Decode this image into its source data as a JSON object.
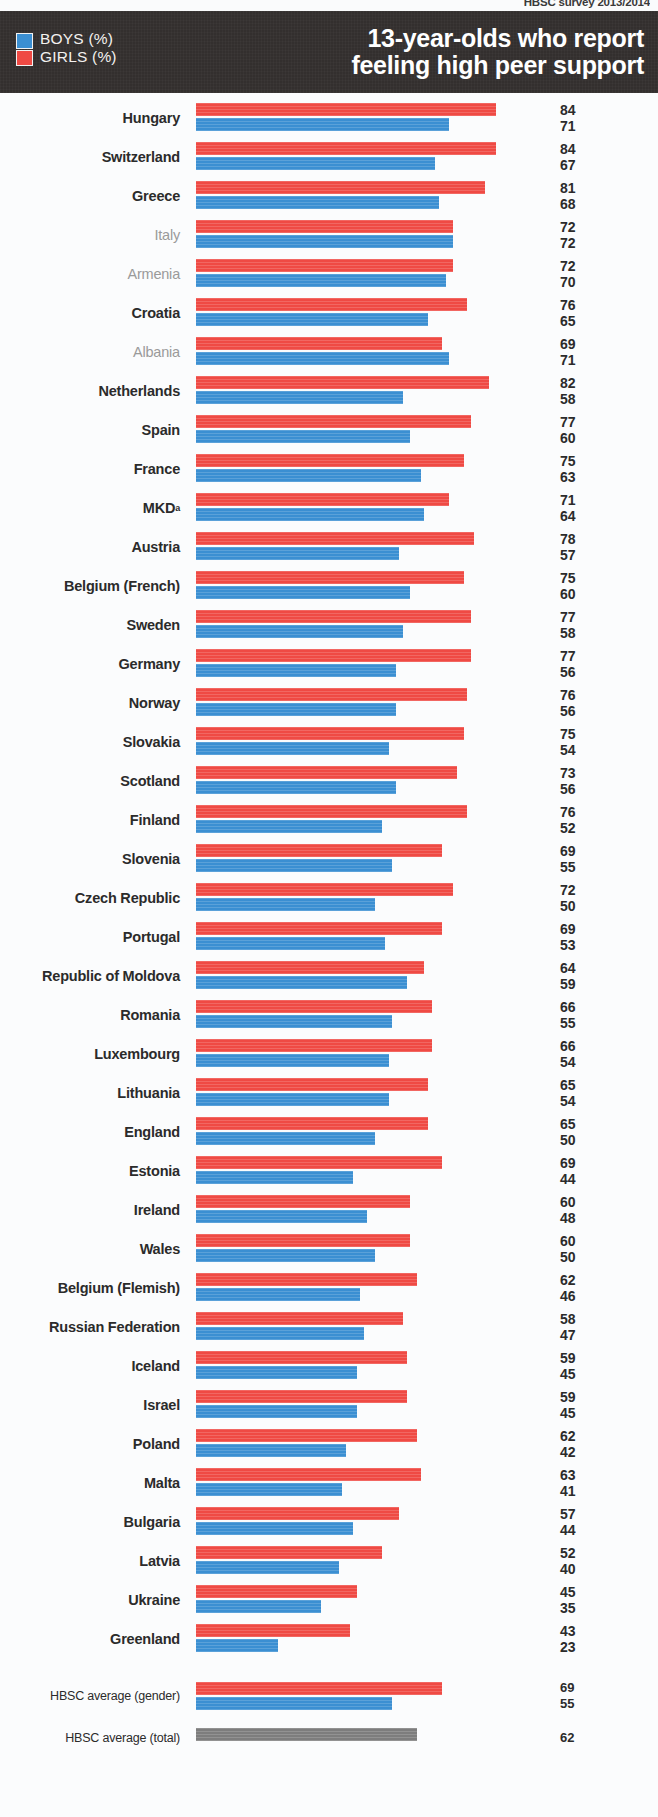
{
  "source_line": "HBSC survey 2013/2014",
  "header": {
    "title": "13-year-olds who report\nfeeling high peer support",
    "legend": [
      {
        "label": "BOYS (%)",
        "color": "#3b8fd2",
        "icon": "boys-swatch"
      },
      {
        "label": "GIRLS (%)",
        "color": "#ef4a44",
        "icon": "girls-swatch"
      }
    ]
  },
  "axis": {
    "bar_origin_px": 196,
    "px_per_unit": 3.57
  },
  "averages": [
    {
      "name": "HBSC average (gender)",
      "girls": 69,
      "boys": 55,
      "type": "gender"
    },
    {
      "name": "HBSC average (total)",
      "total": 62,
      "type": "total"
    }
  ],
  "chart_data": {
    "type": "bar",
    "orientation": "horizontal",
    "title": "13-year-olds who report feeling high peer support",
    "subtitle": "HBSC survey 2013/2014",
    "xlabel": "",
    "ylabel": "",
    "xlim": [
      0,
      100
    ],
    "grid": false,
    "legend_position": "top-left",
    "legend": [
      "BOYS (%)",
      "GIRLS (%)"
    ],
    "note": "Countries in grey/non-bold show no significant gender difference. Superscript a on MKD.",
    "categories": [
      "Hungary",
      "Switzerland",
      "Greece",
      "Italy",
      "Armenia",
      "Croatia",
      "Albania",
      "Netherlands",
      "Spain",
      "France",
      "MKD",
      "Austria",
      "Belgium (French)",
      "Sweden",
      "Germany",
      "Norway",
      "Slovakia",
      "Scotland",
      "Finland",
      "Slovenia",
      "Czech Republic",
      "Portugal",
      "Republic of Moldova",
      "Romania",
      "Luxembourg",
      "Lithuania",
      "England",
      "Estonia",
      "Ireland",
      "Wales",
      "Belgium (Flemish)",
      "Russian Federation",
      "Iceland",
      "Israel",
      "Poland",
      "Malta",
      "Bulgaria",
      "Latvia",
      "Ukraine",
      "Greenland"
    ],
    "series": [
      {
        "name": "GIRLS (%)",
        "color": "#ef4a44",
        "values": [
          84,
          84,
          81,
          72,
          72,
          76,
          69,
          82,
          77,
          75,
          71,
          78,
          75,
          77,
          77,
          76,
          75,
          73,
          76,
          69,
          72,
          69,
          64,
          66,
          66,
          65,
          65,
          69,
          60,
          60,
          62,
          58,
          59,
          59,
          62,
          63,
          57,
          52,
          45,
          43
        ]
      },
      {
        "name": "BOYS (%)",
        "color": "#3b8fd2",
        "values": [
          71,
          67,
          68,
          72,
          70,
          65,
          71,
          58,
          60,
          63,
          64,
          57,
          60,
          58,
          56,
          56,
          54,
          56,
          52,
          55,
          50,
          53,
          59,
          55,
          54,
          54,
          50,
          44,
          48,
          50,
          46,
          47,
          45,
          45,
          42,
          41,
          44,
          40,
          35,
          23
        ]
      }
    ],
    "averages": {
      "girls": 69,
      "boys": 55,
      "total": 62
    }
  },
  "rows": [
    {
      "name": "Hungary",
      "girls": 84,
      "boys": 71,
      "dim": false
    },
    {
      "name": "Switzerland",
      "girls": 84,
      "boys": 67,
      "dim": false
    },
    {
      "name": "Greece",
      "girls": 81,
      "boys": 68,
      "dim": false
    },
    {
      "name": "Italy",
      "girls": 72,
      "boys": 72,
      "dim": true
    },
    {
      "name": "Armenia",
      "girls": 72,
      "boys": 70,
      "dim": true
    },
    {
      "name": "Croatia",
      "girls": 76,
      "boys": 65,
      "dim": false
    },
    {
      "name": "Albania",
      "girls": 69,
      "boys": 71,
      "dim": true
    },
    {
      "name": "Netherlands",
      "girls": 82,
      "boys": 58,
      "dim": false
    },
    {
      "name": "Spain",
      "girls": 77,
      "boys": 60,
      "dim": false
    },
    {
      "name": "France",
      "girls": 75,
      "boys": 63,
      "dim": false
    },
    {
      "name": "MKD",
      "girls": 71,
      "boys": 64,
      "dim": false,
      "sup": "a"
    },
    {
      "name": "Austria",
      "girls": 78,
      "boys": 57,
      "dim": false
    },
    {
      "name": "Belgium (French)",
      "girls": 75,
      "boys": 60,
      "dim": false
    },
    {
      "name": "Sweden",
      "girls": 77,
      "boys": 58,
      "dim": false
    },
    {
      "name": "Germany",
      "girls": 77,
      "boys": 56,
      "dim": false
    },
    {
      "name": "Norway",
      "girls": 76,
      "boys": 56,
      "dim": false
    },
    {
      "name": "Slovakia",
      "girls": 75,
      "boys": 54,
      "dim": false
    },
    {
      "name": "Scotland",
      "girls": 73,
      "boys": 56,
      "dim": false
    },
    {
      "name": "Finland",
      "girls": 76,
      "boys": 52,
      "dim": false
    },
    {
      "name": "Slovenia",
      "girls": 69,
      "boys": 55,
      "dim": false
    },
    {
      "name": "Czech Republic",
      "girls": 72,
      "boys": 50,
      "dim": false
    },
    {
      "name": "Portugal",
      "girls": 69,
      "boys": 53,
      "dim": false
    },
    {
      "name": "Republic of Moldova",
      "girls": 64,
      "boys": 59,
      "dim": false
    },
    {
      "name": "Romania",
      "girls": 66,
      "boys": 55,
      "dim": false
    },
    {
      "name": "Luxembourg",
      "girls": 66,
      "boys": 54,
      "dim": false
    },
    {
      "name": "Lithuania",
      "girls": 65,
      "boys": 54,
      "dim": false
    },
    {
      "name": "England",
      "girls": 65,
      "boys": 50,
      "dim": false
    },
    {
      "name": "Estonia",
      "girls": 69,
      "boys": 44,
      "dim": false
    },
    {
      "name": "Ireland",
      "girls": 60,
      "boys": 48,
      "dim": false
    },
    {
      "name": "Wales",
      "girls": 60,
      "boys": 50,
      "dim": false
    },
    {
      "name": "Belgium (Flemish)",
      "girls": 62,
      "boys": 46,
      "dim": false
    },
    {
      "name": "Russian Federation",
      "girls": 58,
      "boys": 47,
      "dim": false
    },
    {
      "name": "Iceland",
      "girls": 59,
      "boys": 45,
      "dim": false
    },
    {
      "name": "Israel",
      "girls": 59,
      "boys": 45,
      "dim": false
    },
    {
      "name": "Poland",
      "girls": 62,
      "boys": 42,
      "dim": false
    },
    {
      "name": "Malta",
      "girls": 63,
      "boys": 41,
      "dim": false
    },
    {
      "name": "Bulgaria",
      "girls": 57,
      "boys": 44,
      "dim": false
    },
    {
      "name": "Latvia",
      "girls": 52,
      "boys": 40,
      "dim": false
    },
    {
      "name": "Ukraine",
      "girls": 45,
      "boys": 35,
      "dim": false
    },
    {
      "name": "Greenland",
      "girls": 43,
      "boys": 23,
      "dim": false
    }
  ]
}
